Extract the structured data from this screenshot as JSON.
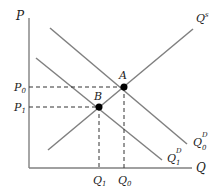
{
  "diagram": {
    "type": "supply-demand",
    "axes": {
      "y_label": "P",
      "x_label": "Q"
    },
    "curves": {
      "supply": {
        "label": "Q",
        "sup": "s"
      },
      "demand0": {
        "label": "Q",
        "sup": "D",
        "sub": "0"
      },
      "demand1": {
        "label": "Q",
        "sup": "D",
        "sub": "1"
      }
    },
    "points": {
      "A": {
        "label": "A"
      },
      "B": {
        "label": "B"
      }
    },
    "ticks": {
      "P0": {
        "label": "P",
        "sub": "0"
      },
      "P1": {
        "label": "P",
        "sub": "1"
      },
      "Q1": {
        "label": "Q",
        "sub": "1"
      },
      "Q0": {
        "label": "Q",
        "sub": "0"
      }
    },
    "colors": {
      "curve": "#808080",
      "axis": "#808080",
      "dash": "#333333",
      "point": "#000000"
    }
  }
}
